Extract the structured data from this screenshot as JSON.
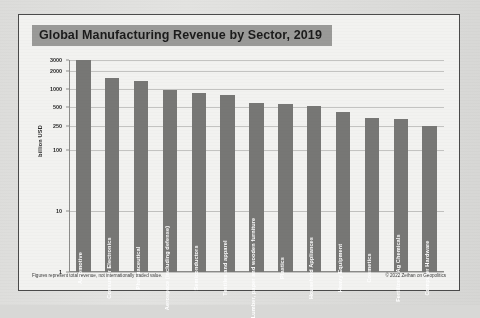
{
  "chart_data": {
    "type": "bar",
    "title": "Global Manufacturing Revenue by Sector, 2019",
    "xlabel": "",
    "ylabel": "billion USD",
    "yscale": "log",
    "ylim": [
      1,
      3000
    ],
    "grid": true,
    "legend": "none",
    "yticks": [
      {
        "value": 3000,
        "label": "3000"
      },
      {
        "value": 2000,
        "label": "2000"
      },
      {
        "value": 1000,
        "label": "1000"
      },
      {
        "value": 500,
        "label": "500"
      },
      {
        "value": 250,
        "label": "250"
      },
      {
        "value": 100,
        "label": "100"
      },
      {
        "value": 10,
        "label": "10"
      },
      {
        "value": 1,
        "label": "1"
      }
    ],
    "categories": [
      "Automotive",
      "Consumer Electronics",
      "Pharmaceutical",
      "Aerospace (including defense)",
      "Semiconductors",
      "Textiles and apparel",
      "Lumber, paper and wooden furniture",
      "Plastics",
      "Household Appliances",
      "Heavy Equipment",
      "Cosmetics",
      "Fertilizers/Ag Chemicals",
      "Computer Hardware"
    ],
    "values": [
      3000,
      1500,
      1350,
      950,
      850,
      800,
      600,
      560,
      520,
      420,
      340,
      320,
      250
    ],
    "bar_color": "#777775"
  },
  "annotations": {
    "footnote_left": "Figures represent total revenue, not internationally traded value.",
    "footnote_right": "© 2022 Zeihan on Geopolitics"
  },
  "colors": {
    "title_band": "#9a9a98",
    "bar": "#777775",
    "grid": "#c3c3c1",
    "frame": "#4a4a4a",
    "paper": "#f2f2f0"
  }
}
